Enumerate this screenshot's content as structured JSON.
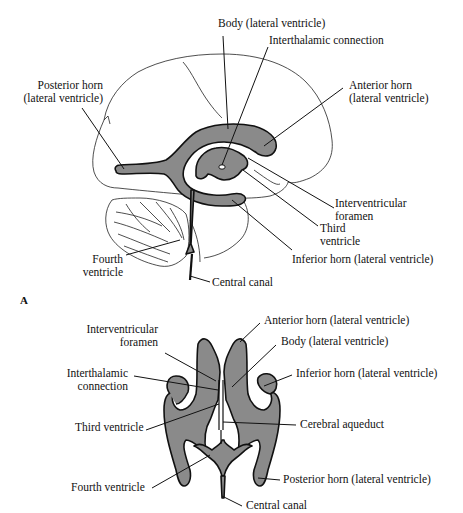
{
  "figure": {
    "panel_a": {
      "letter": "A",
      "view": "lateral",
      "labels": {
        "body": "Body (lateral ventricle)",
        "interthalamic": "Interthalamic connection",
        "posterior_horn_1": "Posterior horn",
        "posterior_horn_2": "(lateral ventricle)",
        "anterior_horn_1": "Anterior horn",
        "anterior_horn_2": "(lateral ventricle)",
        "interventricular_1": "Interventricular",
        "interventricular_2": "foramen",
        "third_1": "Third",
        "third_2": "ventricle",
        "fourth_1": "Fourth",
        "fourth_2": "ventricle",
        "inferior_horn": "Inferior horn (lateral ventricle)",
        "central_canal": "Central canal"
      }
    },
    "panel_b": {
      "view": "dorsal",
      "labels": {
        "interventricular_1": "Interventricular",
        "interventricular_2": "foramen",
        "anterior_horn": "Anterior horn (lateral ventricle)",
        "body": "Body (lateral ventricle)",
        "interthalamic_1": "Interthalamic",
        "interthalamic_2": "connection",
        "inferior_horn": "Inferior horn (lateral ventricle)",
        "third": "Third ventricle",
        "cerebral_aqueduct": "Cerebral aqueduct",
        "posterior_horn": "Posterior horn (lateral ventricle)",
        "fourth": "Fourth ventricle",
        "central_canal": "Central canal"
      }
    },
    "colors": {
      "ventricle_fill": "#8a8a8a",
      "outline": "#111111",
      "background": "#ffffff"
    }
  }
}
